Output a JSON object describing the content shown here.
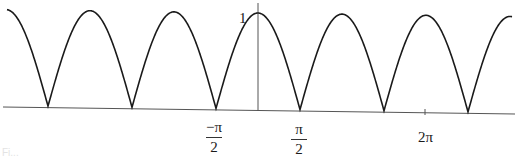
{
  "chart_data": {
    "type": "line",
    "title": "",
    "function": "y = |cos x|",
    "xlabel": "",
    "ylabel": "",
    "grid": false,
    "legend": null,
    "xlim": [
      -3.14,
      3.01
    ],
    "ylim": [
      0,
      1.05
    ],
    "x_units": "radians",
    "pixels_per_pi": 84,
    "origin_px": {
      "x": 258,
      "y": 110
    },
    "unit_y_px": 96,
    "x_tick_labels": [
      {
        "label_num": "−π",
        "label_den": "2",
        "value": -1.5708
      },
      {
        "label_num": "π",
        "label_den": "2",
        "value": 1.5708
      },
      {
        "label": "2π",
        "value": 6.2832
      }
    ],
    "y_tick_labels": [
      {
        "label": "1",
        "value": 1
      }
    ],
    "zeros": [
      -7.854,
      -4.712,
      -1.5708,
      1.5708,
      4.712,
      7.854
    ],
    "peaks": [
      -9.425,
      -6.283,
      -3.1416,
      0,
      3.1416,
      6.283,
      9.425
    ],
    "series": [
      {
        "name": "|cos x|",
        "x": [
          -9.425,
          -7.854,
          -6.283,
          -4.712,
          -3.1416,
          -1.5708,
          0,
          1.5708,
          3.1416,
          4.712,
          6.283,
          7.854,
          9.425
        ],
        "values": [
          1,
          0,
          1,
          0,
          1,
          0,
          1,
          0,
          1,
          0,
          1,
          0,
          1
        ]
      }
    ],
    "colors": {
      "curve": "#1a1a1a",
      "axis": "#555555"
    }
  },
  "labels": {
    "y_one": "1",
    "neg_pi_over_2_num": "−π",
    "neg_pi_over_2_den": "2",
    "pi_over_2_num": "π",
    "pi_over_2_den": "2",
    "two_pi": "2π"
  },
  "caption_fragment": "Fi..."
}
